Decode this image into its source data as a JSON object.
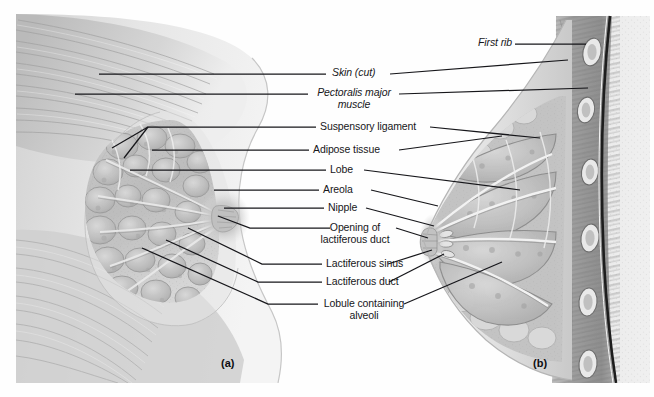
{
  "figure": {
    "background_color": "#fefefe",
    "leader_line_color": "#16161a",
    "panels": [
      {
        "id": "a",
        "label": "(a)",
        "view": "sagittal section, lactating breast"
      },
      {
        "id": "b",
        "label": "(b)",
        "view": "sagittal section through chest wall"
      }
    ],
    "labels": [
      {
        "id": "first-rib",
        "text": "First rib",
        "italic": true,
        "lines": [
          "First rib"
        ]
      },
      {
        "id": "skin-cut",
        "text": "Skin (cut)",
        "italic": true,
        "lines": [
          "Skin (cut)"
        ]
      },
      {
        "id": "pectoralis-major",
        "text": "Pectoralis major muscle",
        "italic": true,
        "lines": [
          "Pectoralis major",
          "muscle"
        ]
      },
      {
        "id": "suspensory-ligament",
        "text": "Suspensory ligament",
        "italic": false,
        "lines": [
          "Suspensory ligament"
        ]
      },
      {
        "id": "adipose-tissue",
        "text": "Adipose tissue",
        "italic": false,
        "lines": [
          "Adipose tissue"
        ]
      },
      {
        "id": "lobe",
        "text": "Lobe",
        "italic": false,
        "lines": [
          "Lobe"
        ]
      },
      {
        "id": "areola",
        "text": "Areola",
        "italic": false,
        "lines": [
          "Areola"
        ]
      },
      {
        "id": "nipple",
        "text": "Nipple",
        "italic": false,
        "lines": [
          "Nipple"
        ]
      },
      {
        "id": "opening-lactiferous-duct",
        "text": "Opening of lactiferous duct",
        "italic": false,
        "lines": [
          "Opening of",
          "lactiferous duct"
        ]
      },
      {
        "id": "lactiferous-sinus",
        "text": "Lactiferous sinus",
        "italic": false,
        "lines": [
          "Lactiferous sinus"
        ]
      },
      {
        "id": "lactiferous-duct",
        "text": "Lactiferous duct",
        "italic": false,
        "lines": [
          "Lactiferous duct"
        ]
      },
      {
        "id": "lobule-alveoli",
        "text": "Lobule containing alveoli",
        "italic": false,
        "lines": [
          "Lobule containing",
          "alveoli"
        ]
      }
    ]
  }
}
